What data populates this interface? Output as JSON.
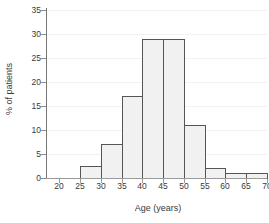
{
  "chart_data": {
    "type": "bar",
    "title": "",
    "xlabel": "Age (years)",
    "ylabel": "% of patients",
    "xlim": [
      17,
      70
    ],
    "ylim": [
      0,
      35
    ],
    "xticks": [
      20,
      25,
      30,
      35,
      40,
      45,
      50,
      55,
      60,
      65,
      70
    ],
    "yticks": [
      0,
      5,
      10,
      15,
      20,
      25,
      30,
      35
    ],
    "grid": true,
    "legend": null,
    "bin_edges": [
      25,
      30,
      35,
      40,
      45,
      50,
      55,
      60,
      65,
      70
    ],
    "categories": [
      "25-30",
      "30-35",
      "35-40",
      "40-45",
      "45-50",
      "50-55",
      "55-60",
      "60-65",
      "65-70"
    ],
    "values": [
      2.5,
      7,
      17,
      29,
      29,
      11,
      2,
      1,
      1
    ],
    "bar_fill_color": "#f1f1f1",
    "bar_edge_color": "#555555",
    "axis_color": "#8d8d8d",
    "text_color": "#3a3a3a"
  }
}
